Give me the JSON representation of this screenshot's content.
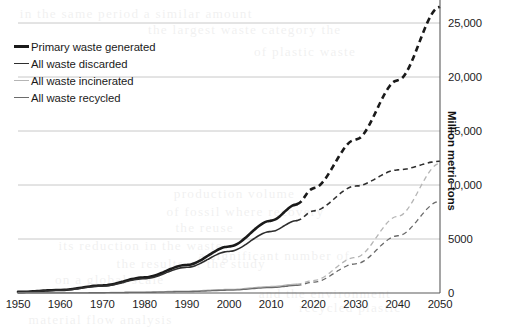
{
  "chart_data": {
    "type": "line",
    "title": "",
    "subtitle": "",
    "xlabel": "",
    "ylabel": "Million metric tons",
    "xlim": [
      1950,
      2050
    ],
    "ylim": [
      0,
      27500
    ],
    "xticks": [
      1950,
      1960,
      1970,
      1980,
      1990,
      2000,
      2010,
      2020,
      2030,
      2040,
      2050
    ],
    "yticks": [
      0,
      5000,
      10000,
      15000,
      20000,
      25000
    ],
    "ytick_labels": [
      "0",
      "5000",
      "10,000",
      "15,000",
      "20,000",
      "25,000"
    ],
    "grid": "horizontal",
    "legend_position": "top-left",
    "projection_start_year": 2016,
    "x": [
      1950,
      1960,
      1970,
      1980,
      1990,
      2000,
      2010,
      2016,
      2020,
      2030,
      2040,
      2050
    ],
    "series": [
      {
        "name": "Primary waste generated",
        "color": "#1a1a1a",
        "width": 2.6,
        "values": [
          100,
          280,
          700,
          1450,
          2600,
          4300,
          6700,
          8200,
          9700,
          14200,
          19700,
          26500
        ]
      },
      {
        "name": "All waste discarded",
        "color": "#2e2e2e",
        "width": 1.6,
        "values": [
          90,
          255,
          640,
          1330,
          2380,
          3850,
          5700,
          6700,
          7600,
          9900,
          11400,
          12200
        ]
      },
      {
        "name": "All waste incinerated",
        "color": "#b5b5b5",
        "width": 1.3,
        "values": [
          5,
          15,
          40,
          90,
          180,
          330,
          600,
          820,
          1150,
          3300,
          7100,
          12000
        ]
      },
      {
        "name": "All waste recycled",
        "color": "#6b6b6b",
        "width": 1.3,
        "values": [
          2,
          8,
          25,
          60,
          130,
          260,
          500,
          700,
          1000,
          2700,
          5300,
          8500
        ]
      }
    ]
  },
  "legend": {
    "items": [
      {
        "label": "Primary waste generated"
      },
      {
        "label": "All waste discarded"
      },
      {
        "label": "All waste incinerated"
      },
      {
        "label": "All waste recycled"
      }
    ]
  },
  "axes": {
    "y_title": "Million metric tons"
  },
  "background_artifacts": [
    {
      "text": "in the same period a similar amount",
      "x": 22,
      "y": 6
    },
    {
      "text": "the largest waste category the",
      "x": 150,
      "y": 22
    },
    {
      "text": "of plastic waste",
      "x": 255,
      "y": 44
    },
    {
      "text": "production volume",
      "x": 175,
      "y": 186
    },
    {
      "text": "of fossil where recovery",
      "x": 168,
      "y": 204
    },
    {
      "text": "the reuse",
      "x": 176,
      "y": 220
    },
    {
      "text": "its reduction in the waste",
      "x": 60,
      "y": 238
    },
    {
      "text": "a significant number of",
      "x": 200,
      "y": 248
    },
    {
      "text": "the results of the study",
      "x": 118,
      "y": 256
    },
    {
      "text": "on a global scale",
      "x": 56,
      "y": 272
    },
    {
      "text": "and the environment",
      "x": 260,
      "y": 286
    },
    {
      "text": "recycled plastic",
      "x": 300,
      "y": 300
    },
    {
      "text": "material flow analysis",
      "x": 30,
      "y": 312
    }
  ]
}
